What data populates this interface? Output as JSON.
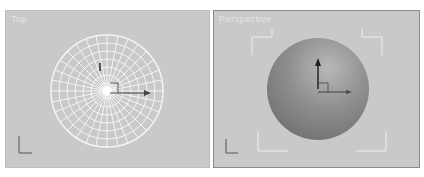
{
  "viewports": [
    {
      "label": "Top",
      "mode": "wireframe",
      "object": "sphere"
    },
    {
      "label": "Perspective",
      "mode": "smooth",
      "object": "sphere",
      "active": true
    }
  ],
  "axis_labels": {
    "x": "x",
    "y": "y",
    "z": "z"
  },
  "colors": {
    "viewport_bg": "#c9c9c9",
    "wire": "#f4f4f4",
    "active_border": "#8a8a8a"
  }
}
